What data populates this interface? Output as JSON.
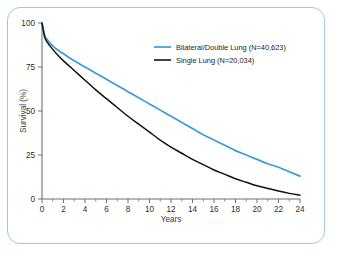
{
  "figure": {
    "frame_color": "#9fc8e3",
    "background": "#ffffff"
  },
  "chart_data": {
    "type": "line",
    "title": "",
    "subtitle": "",
    "xlabel": "Years",
    "ylabel": "Survival (%)",
    "xlim": [
      0,
      24
    ],
    "ylim": [
      0,
      100
    ],
    "xticks": [
      0,
      2,
      4,
      6,
      8,
      10,
      12,
      14,
      16,
      18,
      20,
      22,
      24
    ],
    "xtick_labels": [
      "0",
      "2",
      "4",
      "6",
      "8",
      "10",
      "12",
      "14",
      "16",
      "18",
      "20",
      "22",
      "24"
    ],
    "x_minor_tick_step": 1,
    "yticks": [
      0,
      25,
      50,
      75,
      100
    ],
    "ytick_labels": [
      "0",
      "25",
      "50",
      "75",
      "100"
    ],
    "grid": false,
    "legend_position": "upper right",
    "series": [
      {
        "name": "Bilateral/Double Lung  (N=40,623)",
        "label": "Bilateral/Double Lung",
        "n_label": "(N=40,623)",
        "n": 40623,
        "color": "#3e9ad6",
        "x": [
          0,
          0.25,
          0.5,
          1,
          1.5,
          2,
          3,
          4,
          5,
          6,
          7,
          8,
          9,
          10,
          11,
          12,
          13,
          14,
          15,
          16,
          17,
          18,
          19,
          20,
          21,
          22,
          23,
          24
        ],
        "values": [
          100,
          93,
          90.5,
          87,
          84.5,
          82.5,
          78.5,
          75,
          71.5,
          68,
          64.5,
          61,
          57.5,
          54,
          50.5,
          47,
          43.5,
          40,
          36.5,
          33.5,
          30.5,
          27.5,
          25,
          22.5,
          20,
          18,
          15.5,
          13
        ]
      },
      {
        "name": "Single Lung  (N=20,034)",
        "label": "Single Lung",
        "n_label": "(N=20,034)",
        "n": 20034,
        "color": "#111111",
        "x": [
          0,
          0.25,
          0.5,
          1,
          1.5,
          2,
          3,
          4,
          5,
          6,
          7,
          8,
          9,
          10,
          11,
          12,
          13,
          14,
          15,
          16,
          17,
          18,
          19,
          20,
          21,
          22,
          23,
          24
        ],
        "values": [
          100,
          92,
          89,
          85,
          81.5,
          78.5,
          73,
          67.5,
          62,
          57,
          52,
          47,
          42.5,
          38,
          33.5,
          29.5,
          26,
          22.5,
          19.5,
          16.5,
          14,
          11.5,
          9.5,
          7.5,
          6,
          4.5,
          3.2,
          2.2
        ]
      }
    ]
  },
  "legend": {
    "entries": [
      {
        "label": "Bilateral/Double Lung  (N=40,623)",
        "color": "#3e9ad6"
      },
      {
        "label": "Single Lung  (N=20,034)",
        "color": "#111111"
      }
    ]
  },
  "axes": {
    "x_title": "Years",
    "y_title": "Survival (%)"
  }
}
